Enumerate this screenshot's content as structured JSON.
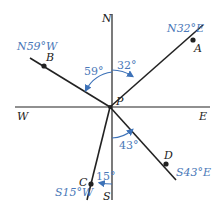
{
  "colors": {
    "line": "#222222",
    "label_blue": "#4a78b8",
    "arc_blue": "#3d72b8",
    "background": "#ffffff"
  },
  "compass": {
    "north": "N",
    "south": "S",
    "east": "E",
    "west": "W",
    "origin": "P"
  },
  "bearings": [
    {
      "point": "A",
      "label": "N32°E",
      "angle": "32°"
    },
    {
      "point": "B",
      "label": "N59°W",
      "angle": "59°"
    },
    {
      "point": "C",
      "label": "S15°W",
      "angle": "15°"
    },
    {
      "point": "D",
      "label": "S43°E",
      "angle": "43°"
    }
  ]
}
